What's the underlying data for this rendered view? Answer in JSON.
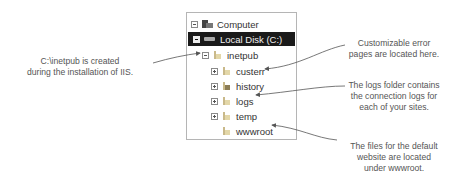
{
  "tree": {
    "items": [
      {
        "label": "Computer",
        "icon": "computer-icon",
        "expander": "minus",
        "level": 0
      },
      {
        "label": "Local Disk (C:)",
        "icon": "disk-icon",
        "expander": "minus",
        "level": 1,
        "selected": true
      },
      {
        "label": "inetpub",
        "icon": "folder-icon",
        "expander": "minus",
        "level": 2
      },
      {
        "label": "custerr",
        "icon": "folder-icon",
        "expander": "plus",
        "level": 3
      },
      {
        "label": "history",
        "icon": "folder-icon",
        "expander": "plus",
        "level": 3
      },
      {
        "label": "logs",
        "icon": "folder-icon",
        "expander": "plus",
        "level": 3
      },
      {
        "label": "temp",
        "icon": "folder-icon",
        "expander": "plus",
        "level": 3
      },
      {
        "label": "wwwroot",
        "icon": "folder-icon",
        "expander": "none",
        "level": 3
      }
    ]
  },
  "annotations": {
    "inetpub": {
      "line1": "C:\\inetpub is created",
      "line2": "during the installation of IIS."
    },
    "custerr": {
      "line1": "Customizable error",
      "line2": "pages are located here."
    },
    "logs": {
      "line1": "The logs folder contains",
      "line2": "the connection logs for",
      "line3": "each of your sites."
    },
    "wwwroot": {
      "line1": "The files for the default",
      "line2": "website are located",
      "line3": "under wwwroot."
    }
  },
  "colors": {
    "selection": "#1a1a1a",
    "text": "#333333",
    "annotation": "#555555",
    "arrow": "#555555"
  }
}
